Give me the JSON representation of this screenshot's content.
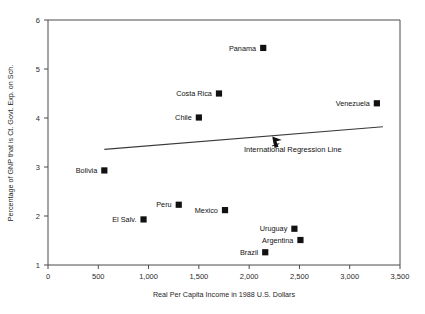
{
  "chart_data": {
    "type": "scatter",
    "title": "",
    "xlabel": "Real Per Capita Income in 1988 U.S. Dollars",
    "ylabel": "Percentage of GNP that is Ct. Govt. Exp. on Sch.",
    "xlim": [
      0,
      3500
    ],
    "ylim": [
      1,
      6
    ],
    "xticks": [
      0,
      500,
      1000,
      1500,
      2000,
      2500,
      3000,
      3500
    ],
    "xticklabels": [
      "0",
      "500",
      "1,000",
      "1,500",
      "2,000",
      "2,500",
      "3,000",
      "3,500"
    ],
    "yticks": [
      1,
      2,
      3,
      4,
      5,
      6
    ],
    "yticklabels": [
      "1",
      "2",
      "3",
      "4",
      "5",
      "6"
    ],
    "grid": false,
    "legend": "none",
    "marker_style": "filled-square",
    "points": [
      {
        "label": "Panama",
        "x": 2140,
        "y": 5.43,
        "label_pos": "left"
      },
      {
        "label": "Costa Rica",
        "x": 1700,
        "y": 4.5,
        "label_pos": "left"
      },
      {
        "label": "Venezuela",
        "x": 3270,
        "y": 4.3,
        "label_pos": "left"
      },
      {
        "label": "Chile",
        "x": 1500,
        "y": 4.01,
        "label_pos": "left"
      },
      {
        "label": "Bolivia",
        "x": 560,
        "y": 2.93,
        "label_pos": "left"
      },
      {
        "label": "Peru",
        "x": 1300,
        "y": 2.23,
        "label_pos": "left"
      },
      {
        "label": "Mexico",
        "x": 1760,
        "y": 2.12,
        "label_pos": "left"
      },
      {
        "label": "El Salv.",
        "x": 950,
        "y": 1.93,
        "label_pos": "left"
      },
      {
        "label": "Uruguay",
        "x": 2450,
        "y": 1.74,
        "label_pos": "left"
      },
      {
        "label": "Argentina",
        "x": 2510,
        "y": 1.51,
        "label_pos": "left"
      },
      {
        "label": "Brazil",
        "x": 2160,
        "y": 1.26,
        "label_pos": "left"
      }
    ],
    "regression_line": {
      "label": "International Regression Line",
      "x_start": 560,
      "y_start": 3.36,
      "x_end": 3330,
      "y_end": 3.82
    },
    "annotation": {
      "text": "International Regression Line",
      "arrow_tip_x": 2230,
      "arrow_tip_y": 3.62
    },
    "colors": {
      "marker": "#111111",
      "line": "#3a3a3a",
      "axis": "#4a4a4a",
      "text": "#111111",
      "background": "#ffffff"
    }
  }
}
